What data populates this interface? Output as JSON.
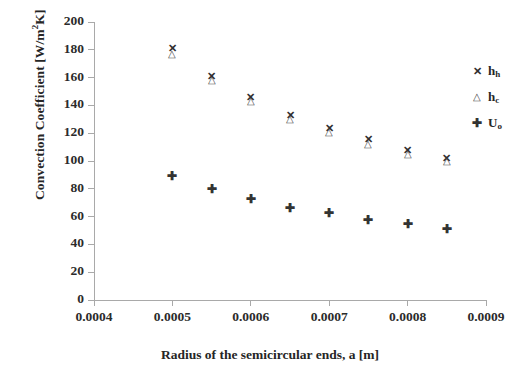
{
  "chart_data": {
    "type": "scatter",
    "title": "",
    "xlabel": "Radius of the semicircular ends, a [m]",
    "ylabel": "Convection Coefficient [W/m²K]",
    "ylabel_parts": {
      "pre": "Convection Coefficient [W/m",
      "sup": "2",
      "post": "K]"
    },
    "xlim": [
      0.0004,
      0.0009
    ],
    "ylim": [
      0,
      200
    ],
    "grid": false,
    "legend_position": "right",
    "x_tick_labels": [
      "0.0004",
      "0.0005",
      "0.0006",
      "0.0007",
      "0.0008",
      "0.0009"
    ],
    "x_ticks": [
      0.0004,
      0.0005,
      0.0006,
      0.0007,
      0.0008,
      0.0009
    ],
    "y_tick_labels": [
      "0",
      "20",
      "40",
      "60",
      "80",
      "100",
      "120",
      "140",
      "160",
      "180",
      "200"
    ],
    "y_ticks": [
      0,
      20,
      40,
      60,
      80,
      100,
      120,
      140,
      160,
      180,
      200
    ],
    "x": [
      0.0005,
      0.00055,
      0.0006,
      0.00065,
      0.0007,
      0.00075,
      0.0008,
      0.00085
    ],
    "series": [
      {
        "name": "h_h",
        "label_pre": "h",
        "label_sub": "h",
        "marker": "x",
        "values": [
          181,
          161,
          146,
          133,
          124,
          116,
          108,
          102
        ]
      },
      {
        "name": "h_c",
        "label_pre": "h",
        "label_sub": "c",
        "marker": "triangle",
        "values": [
          177,
          158,
          143,
          130,
          121,
          112,
          105,
          100
        ]
      },
      {
        "name": "U_o",
        "label_pre": "U",
        "label_sub": "o",
        "marker": "plus",
        "values": [
          89,
          80,
          73,
          66.5,
          62.5,
          57.5,
          54.5,
          51
        ]
      }
    ]
  },
  "colors": {
    "axis": "#a9a9a9",
    "text": "#262626",
    "marker": "#333333",
    "background": "#ffffff"
  }
}
